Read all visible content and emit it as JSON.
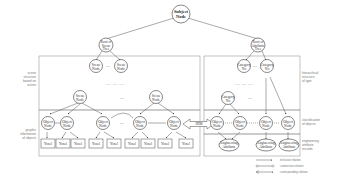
{
  "diagram": {
    "root": {
      "label_line1": "Subject",
      "label_line2": "Node"
    },
    "scene_root": {
      "line1": "Root of",
      "line2": "Scene",
      "line3": "Tree"
    },
    "attr_root": {
      "line1": "Root of",
      "line2": "Attribute",
      "line3": "Tree"
    },
    "scene_node": {
      "line1": "Scene",
      "line2": "Node"
    },
    "category_node": {
      "line1": "Category",
      "line2": "No"
    },
    "object_node": {
      "line1": "Object",
      "line2": "Node"
    },
    "yosel": "Yosel",
    "engineering_attr": {
      "line1": "Engineering",
      "line2": "Attribute"
    },
    "ellipsis": "...",
    "ellipsis_row": "…  …  …",
    "bridge_label": "IIIM",
    "left_labels": {
      "scene_structure": [
        "scene",
        "structure",
        "based on",
        "octree"
      ],
      "graphic_information": [
        "graphic",
        "information",
        "of objects"
      ]
    },
    "right_labels": {
      "hierarchical_structure": [
        "hierarchical",
        "structure",
        "of type"
      ],
      "classification": [
        "classification",
        "of objects"
      ],
      "engineering_records": [
        "engineering",
        "attribute",
        "records"
      ]
    },
    "legend": [
      {
        "label": "inclusive relation",
        "style": "arrow-filled"
      },
      {
        "label": "connection relation",
        "style": "circle-ends"
      },
      {
        "label": "corresponding relation",
        "style": "double-arrow"
      }
    ]
  }
}
